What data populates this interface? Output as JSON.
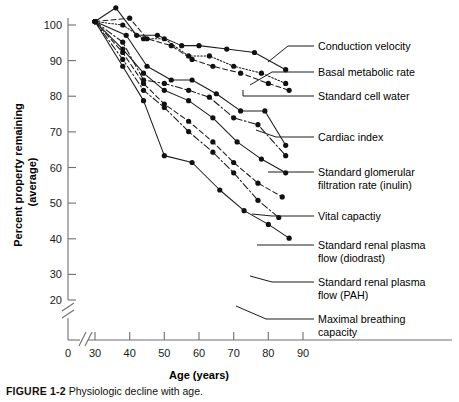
{
  "figure": {
    "caption_label": "FIGURE 1-2",
    "caption_text": "Physiologic decline with age."
  },
  "axes": {
    "x_title": "Age (years)",
    "y_title_line1": "Percent property remaining",
    "y_title_line2": "(average)",
    "x_ticks": [
      "0",
      "30",
      "40",
      "50",
      "60",
      "70",
      "80",
      "90"
    ],
    "y_ticks": [
      "20",
      "30",
      "40",
      "50",
      "60",
      "70",
      "80",
      "90",
      "100"
    ],
    "x_origin_label": "0",
    "axis_break": "//",
    "grid": false
  },
  "chart_data": {
    "type": "line",
    "title": "",
    "xlabel": "Age (years)",
    "ylabel": "Percent property remaining (average)",
    "xlim": [
      28,
      92
    ],
    "ylim": [
      18,
      106
    ],
    "x_ticks": [
      30,
      40,
      50,
      60,
      70,
      80,
      90
    ],
    "y_ticks": [
      20,
      30,
      40,
      50,
      60,
      70,
      80,
      90,
      100
    ],
    "grid": false,
    "legend": "right-side leader-line labels",
    "series": [
      {
        "name": "Conduction velocity",
        "style": "solid",
        "points": [
          [
            30,
            101
          ],
          [
            36,
            105
          ],
          [
            42,
            97
          ],
          [
            48,
            97
          ],
          [
            55,
            94
          ],
          [
            60,
            94
          ],
          [
            68,
            93
          ],
          [
            76,
            92
          ],
          [
            85,
            87
          ]
        ]
      },
      {
        "name": "Basal metabolic rate",
        "style": "dotted",
        "points": [
          [
            30,
            101
          ],
          [
            38,
            100
          ],
          [
            44,
            96
          ],
          [
            50,
            96
          ],
          [
            57,
            91
          ],
          [
            63,
            91
          ],
          [
            70,
            88
          ],
          [
            78,
            86
          ],
          [
            85,
            83
          ]
        ]
      },
      {
        "name": "Standard cell water",
        "style": "dashed",
        "points": [
          [
            30,
            101
          ],
          [
            40,
            102
          ],
          [
            45,
            96
          ],
          [
            52,
            94
          ],
          [
            58,
            90
          ],
          [
            64,
            88
          ],
          [
            72,
            86
          ],
          [
            80,
            83
          ],
          [
            86,
            81
          ]
        ]
      },
      {
        "name": "Cardiac index",
        "style": "solid",
        "points": [
          [
            30,
            101
          ],
          [
            39,
            97
          ],
          [
            45,
            88
          ],
          [
            52,
            84
          ],
          [
            58,
            84
          ],
          [
            65,
            80
          ],
          [
            72,
            75
          ],
          [
            79,
            75
          ],
          [
            85,
            65
          ]
        ]
      },
      {
        "name": "Standard glomerular filtration rate (inulin)",
        "style": "dash-dot",
        "points": [
          [
            30,
            101
          ],
          [
            38,
            95
          ],
          [
            44,
            84
          ],
          [
            50,
            83
          ],
          [
            57,
            81
          ],
          [
            63,
            79
          ],
          [
            70,
            73
          ],
          [
            77,
            71
          ],
          [
            85,
            62
          ]
        ]
      },
      {
        "name": "Vital capactiy",
        "style": "solid",
        "points": [
          [
            30,
            101
          ],
          [
            38,
            93
          ],
          [
            44,
            86
          ],
          [
            50,
            81
          ],
          [
            57,
            78
          ],
          [
            64,
            73
          ],
          [
            71,
            66
          ],
          [
            78,
            61
          ],
          [
            85,
            57
          ]
        ]
      },
      {
        "name": "Standard renal plasma flow (diodrast)",
        "style": "dashed",
        "points": [
          [
            30,
            101
          ],
          [
            38,
            92
          ],
          [
            44,
            83
          ],
          [
            50,
            77
          ],
          [
            57,
            72
          ],
          [
            64,
            66
          ],
          [
            70,
            60
          ],
          [
            77,
            54
          ],
          [
            84,
            50
          ]
        ]
      },
      {
        "name": "Standard renal plasma flow (PAH)",
        "style": "dash-dot",
        "points": [
          [
            30,
            101
          ],
          [
            38,
            90
          ],
          [
            44,
            81
          ],
          [
            50,
            76
          ],
          [
            57,
            69
          ],
          [
            64,
            63
          ],
          [
            70,
            57
          ],
          [
            77,
            49
          ],
          [
            83,
            44
          ]
        ]
      },
      {
        "name": "Maximal breathing capacity",
        "style": "solid",
        "points": [
          [
            30,
            101
          ],
          [
            38,
            88
          ],
          [
            44,
            78
          ],
          [
            50,
            62
          ],
          [
            58,
            60
          ],
          [
            66,
            52
          ],
          [
            73,
            46
          ],
          [
            80,
            42
          ],
          [
            86,
            38
          ]
        ]
      }
    ]
  },
  "labels": [
    {
      "text": "Conduction velocity",
      "x": 318,
      "y": 48
    },
    {
      "text": "Basal metabolic rate",
      "x": 318,
      "y": 74
    },
    {
      "text": "Standard cell water",
      "x": 318,
      "y": 98
    },
    {
      "text": "Cardiac index",
      "x": 318,
      "y": 140
    },
    {
      "text": "Standard glomerular",
      "x": 318,
      "y": 176
    },
    {
      "text": "filtration rate (inulin)",
      "x": 318,
      "y": 189
    },
    {
      "text": "Vital capactiy",
      "x": 318,
      "y": 219
    },
    {
      "text": "Standard renal plasma",
      "x": 318,
      "y": 248
    },
    {
      "text": "flow (diodrast)",
      "x": 318,
      "y": 261
    },
    {
      "text": "Standard renal plasma",
      "x": 318,
      "y": 285
    },
    {
      "text": "flow (PAH)",
      "x": 318,
      "y": 298
    },
    {
      "text": "Maximal breathing",
      "x": 318,
      "y": 322
    },
    {
      "text": "capacity",
      "x": 318,
      "y": 335
    }
  ]
}
